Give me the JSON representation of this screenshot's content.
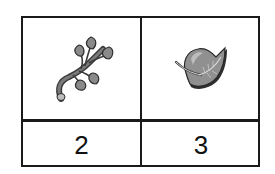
{
  "table": {
    "columns": [
      {
        "icon": "branch-with-leaves-icon",
        "value": "2"
      },
      {
        "icon": "single-leaf-icon",
        "value": "3"
      }
    ]
  },
  "colors": {
    "border": "#1a1a1a",
    "icon_fill": "#8a8a8a",
    "icon_dark": "#3a3a3a"
  }
}
